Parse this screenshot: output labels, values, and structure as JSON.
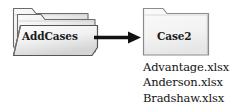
{
  "diagram": {
    "type": "flow-diagram",
    "background_color": "#ffffff",
    "nodes": [
      {
        "id": "addcases",
        "shape": "folder-stack",
        "label": "AddCases",
        "fill_color": "#eeeeee",
        "stroke_color": "#555555"
      },
      {
        "id": "case2",
        "shape": "folder",
        "label": "Case2",
        "fill_color": "#f2f2f2",
        "stroke_color": "#8c8c8c"
      }
    ],
    "connector": {
      "id": "addcases-to-case2",
      "type": "arrow",
      "direction": "right",
      "color": "#111111"
    },
    "file_list": {
      "files": [
        "Advantage.xlsx",
        "Anderson.xlsx",
        "Bradshaw.xlsx"
      ]
    }
  }
}
